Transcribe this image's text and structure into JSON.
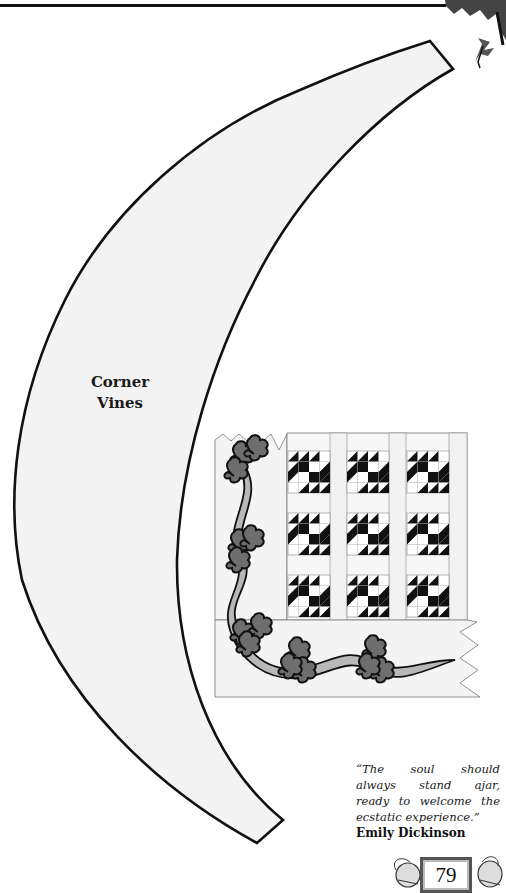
{
  "pattern": {
    "title_line1": "Corner",
    "title_line2": "Vines",
    "piece_fill": "#f3f3f3",
    "outline_color": "#111111"
  },
  "illustration": {
    "name": "quilt-corner-vine-preview",
    "block_rows": 3,
    "block_cols": 3,
    "block_color": "#111111",
    "vine_color": "#b8b8b8",
    "leaf_color": "#6e6e6e"
  },
  "quote": {
    "line1": "“The soul should",
    "line2": "always stand ajar,",
    "line3": "ready to welcome the",
    "line4": "ecstatic experience.”",
    "author": "Emily Dickinson"
  },
  "footer": {
    "page_number": "79"
  }
}
